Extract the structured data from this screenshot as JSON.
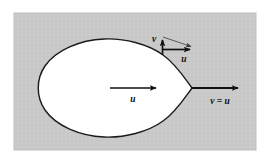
{
  "figure": {
    "name": "velocity-boundary-condition-diagram",
    "caption": "",
    "background_color": "#ffffff",
    "panel": {
      "fill_color": "#c9c9c9",
      "border_color": "#bdbdbd",
      "x": 14,
      "y": 13,
      "width": 242,
      "height": 137
    },
    "body": {
      "name": "teardrop-body",
      "fill_color": "#ffffff",
      "stroke_color": "#1a1a1a",
      "stroke_width": 1.4,
      "description": "teardrop shaped solid object"
    },
    "vectors": [
      {
        "id": "center-u",
        "label": "u",
        "kind": "horizontal-arrow",
        "color": "#111111",
        "x1": 110,
        "y1": 88,
        "x2": 160,
        "y2": 88,
        "label_x": 133,
        "label_y": 101,
        "label_size": 9
      },
      {
        "id": "surface-v",
        "label": "v",
        "kind": "vertical-arrow",
        "color": "#111111",
        "x1": 162,
        "y1": 54,
        "x2": 162,
        "y2": 36,
        "label_x": 153,
        "label_y": 41,
        "label_size": 9
      },
      {
        "id": "surface-u",
        "label": "u",
        "kind": "horizontal-arrow",
        "color": "#111111",
        "x1": 162,
        "y1": 49,
        "x2": 195,
        "y2": 49,
        "label_x": 183,
        "label_y": 61,
        "label_size": 9
      },
      {
        "id": "resultant-thin",
        "label": "",
        "kind": "thin-diagonal-arrow",
        "color": "#333333",
        "x1": 162,
        "y1": 36,
        "x2": 196,
        "y2": 47
      },
      {
        "id": "far-field",
        "label": "v = u",
        "kind": "horizontal-arrow",
        "color": "#111111",
        "x1": 192,
        "y1": 88,
        "x2": 243,
        "y2": 88,
        "label_x": 205,
        "label_y": 103,
        "label_size": 9
      }
    ],
    "labels": {
      "v_symbol": "v",
      "u_symbol": "u",
      "v_equals_u": "v = u"
    }
  }
}
